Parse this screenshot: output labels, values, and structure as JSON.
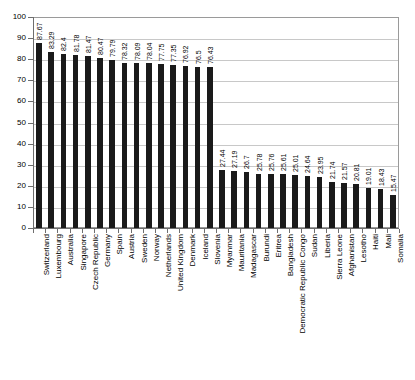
{
  "chart_data": {
    "type": "bar",
    "title": "",
    "subtitle": "",
    "xlabel": "",
    "ylabel": "",
    "ylim": [
      0,
      100
    ],
    "ytick_step": 10,
    "yticks": [
      0,
      10,
      20,
      30,
      40,
      50,
      60,
      70,
      80,
      90,
      100
    ],
    "grid": true,
    "legend": null,
    "bar_color": "#1a1a1a",
    "gridline_color": "#c8c8c8",
    "frame_color": "#9a9a9a",
    "background_color": "#ffffff",
    "value_labels_shown": true,
    "categories": [
      "Switzerland",
      "Luxembourg",
      "Australia",
      "Singapore",
      "Czech Republic",
      "Germany",
      "Spain",
      "Austria",
      "Sweden",
      "Norway",
      "Netherlands",
      "United Kingdom",
      "Denmark",
      "Iceland",
      "Slovenia",
      "Myanmar",
      "Mauritania",
      "Madagascar",
      "Burundi",
      "Eritrea",
      "Bangladesh",
      "Democratic Republic Congo",
      "Sudan",
      "Liberia",
      "Sierra Leone",
      "Afghanistan",
      "Lesotho",
      "Haiti",
      "Mali",
      "Somalia"
    ],
    "values": [
      87.67,
      83.29,
      82.4,
      81.78,
      81.47,
      80.47,
      79.79,
      78.32,
      78.09,
      78.04,
      77.75,
      77.35,
      76.92,
      76.5,
      76.43,
      27.44,
      27.19,
      26.7,
      25.78,
      25.76,
      25.61,
      25.01,
      24.64,
      23.95,
      21.74,
      21.57,
      20.81,
      19.01,
      18.43,
      15.47
    ],
    "value_labels": [
      "87.67",
      "83.29",
      "82.4",
      "81.78",
      "81.47",
      "80.47",
      "79.79",
      "78.32",
      "78.09",
      "78.04",
      "77.75",
      "77.35",
      "76.92",
      "76.5",
      "76.43",
      "27.44",
      "27.19",
      "26.7",
      "25.78",
      "25.76",
      "25.61",
      "25.01",
      "24.64",
      "23.95",
      "21.74",
      "21.57",
      "20.81",
      "19.01",
      "18.43",
      "15.47"
    ]
  }
}
